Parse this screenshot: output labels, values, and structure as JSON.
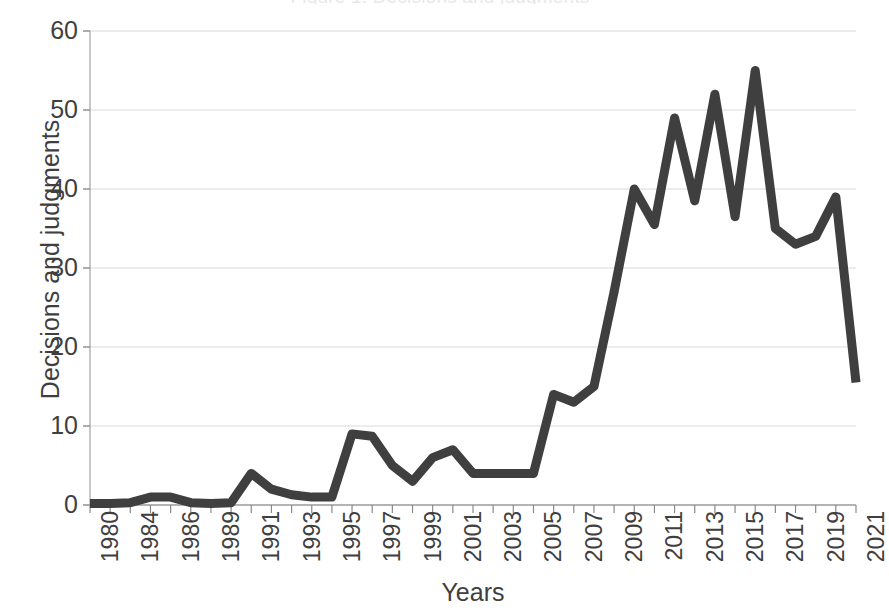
{
  "chart_data": {
    "type": "line",
    "title": "",
    "xlabel": "Years",
    "ylabel": "Decisions and judgments",
    "ylim": [
      0,
      60
    ],
    "yticks": [
      0,
      10,
      20,
      30,
      40,
      50,
      60
    ],
    "grid": "horizontal",
    "legend": "none",
    "line_color": "#3f3f3f",
    "line_width": 9,
    "categories": [
      "1980",
      "1983",
      "1984",
      "1985",
      "1986",
      "1987",
      "1989",
      "1990",
      "1991",
      "1992",
      "1993",
      "1994",
      "1995",
      "1996",
      "1997",
      "1998",
      "1999",
      "2000",
      "2001",
      "2002",
      "2003",
      "2004",
      "2005",
      "2006",
      "2007",
      "2008",
      "2009",
      "2010",
      "2011",
      "2012",
      "2013",
      "2014",
      "2015",
      "2016",
      "2017",
      "2018",
      "2019",
      "2020",
      "2021"
    ],
    "values": [
      0.2,
      0.2,
      0.3,
      1,
      1,
      0.3,
      0.2,
      0.3,
      4,
      2,
      1.3,
      1,
      1,
      9,
      8.7,
      5,
      3,
      6,
      7,
      4,
      4,
      4,
      4,
      14,
      13,
      15,
      27,
      40,
      35.5,
      49,
      38.5,
      52,
      36.5,
      55,
      35,
      33,
      34,
      39,
      15.5
    ],
    "x_tick_labels": [
      "1980",
      "1984",
      "1986",
      "1989",
      "1991",
      "1993",
      "1995",
      "1997",
      "1999",
      "2001",
      "2003",
      "2005",
      "2007",
      "2009",
      "2011",
      "2013",
      "2015",
      "2017",
      "2019",
      "2021"
    ],
    "x_tick_label_indices": [
      0,
      2,
      4,
      6,
      8,
      10,
      12,
      14,
      16,
      18,
      20,
      22,
      24,
      26,
      28,
      30,
      32,
      34,
      36,
      38
    ],
    "x_tick_label_rotation": -90,
    "annotations": []
  },
  "axes": {
    "y_title": "Decisions and judgments",
    "x_title": "Years"
  },
  "title_remnant": "Figure 1. Decisions and judgments"
}
